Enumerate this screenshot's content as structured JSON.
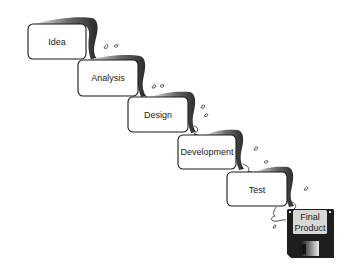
{
  "diagram": {
    "type": "waterfall-process",
    "stages": [
      {
        "label": "Idea"
      },
      {
        "label": "Analysis"
      },
      {
        "label": "Design"
      },
      {
        "label": "Development"
      },
      {
        "label": "Test"
      }
    ],
    "final": {
      "line1": "Final",
      "line2": "Product",
      "icon": "floppy-disk-icon"
    }
  },
  "colors": {
    "box_fill": "#ffffff",
    "box_stroke": "#1a1a1a",
    "stream_dark": "#3a3a3a",
    "stream_light": "#bdbdbd",
    "disk_body": "#1e1e1e",
    "disk_label": "#d8d8d8"
  }
}
